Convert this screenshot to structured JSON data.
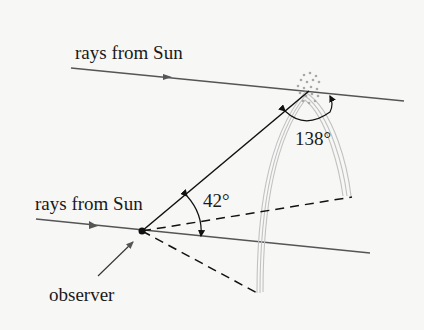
{
  "diagram": {
    "labels": {
      "top_rays": "rays from Sun",
      "bottom_rays": "rays from Sun",
      "observer": "observer",
      "angle_small": "42°",
      "angle_large": "138°"
    },
    "colors": {
      "background": "#f7f7f6",
      "ray_line": "#555555",
      "sight_line": "#111111",
      "rainbow_band": "#bdbdbd",
      "droplets": "#a8a8a8"
    }
  }
}
